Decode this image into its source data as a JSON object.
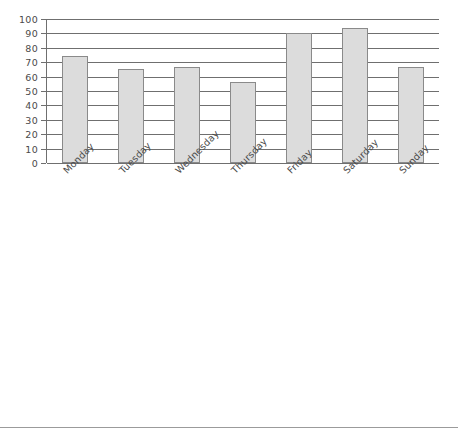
{
  "chart_data": {
    "type": "bar",
    "title": "",
    "subtitle": "",
    "xlabel": "",
    "ylabel": "",
    "categories": [
      "Monday",
      "Tuesday",
      "Wednesday",
      "Thursday",
      "Friday",
      "Saturday",
      "Sunday"
    ],
    "values": [
      74,
      65,
      67,
      56,
      90,
      94,
      67
    ],
    "series": [
      {
        "name": "",
        "values": [
          74,
          65,
          67,
          56,
          90,
          94,
          67
        ]
      }
    ],
    "ylim": [
      0,
      100
    ],
    "ytick_labels": [
      "100",
      "90",
      "80",
      "70",
      "60",
      "50",
      "40",
      "30",
      "20",
      "10",
      "0"
    ],
    "ytick_values": [
      100,
      90,
      80,
      70,
      60,
      50,
      40,
      30,
      20,
      10,
      0
    ],
    "ytick_step": 10,
    "grid": "horizontal",
    "legend": "none",
    "annotations": [],
    "colors": {
      "bar_fill": "#dcdcdc",
      "bar_stroke": "#8a8a8a",
      "gridline": "#6f6f6f",
      "axis": "#6f6f6f",
      "tick_text": "#4a4a4a",
      "background": "#ffffff",
      "bottom_rule": "#9b9b9b"
    },
    "xlabel_rotation_deg": -45
  }
}
